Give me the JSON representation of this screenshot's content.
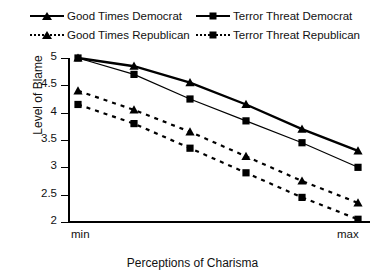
{
  "chart_data": {
    "type": "line",
    "title": "",
    "xlabel": "Perceptions of Charisma",
    "ylabel": "Level of Blame",
    "x": [
      0,
      1,
      2,
      3,
      4,
      5
    ],
    "x_tick_labels": [
      "min",
      "",
      "",
      "",
      "",
      "max"
    ],
    "xlim": [
      0,
      5
    ],
    "ylim": [
      2,
      5
    ],
    "y_ticks": [
      2,
      2.5,
      3,
      3.5,
      4,
      4.5,
      5
    ],
    "y_tick_labels": [
      "2",
      "2.5",
      "3",
      "3.5",
      "4",
      "4.5",
      "5"
    ],
    "grid": false,
    "legend_position": "top",
    "series": [
      {
        "name": "Good Times Democrat",
        "marker": "triangle",
        "line_style": "solid",
        "line_width": 2.4,
        "color": "#000000",
        "values": [
          5.0,
          4.85,
          4.55,
          4.15,
          3.7,
          3.3
        ]
      },
      {
        "name": "Terror Threat Democrat",
        "marker": "square",
        "line_style": "solid",
        "line_width": 1.2,
        "color": "#000000",
        "values": [
          5.0,
          4.7,
          4.25,
          3.85,
          3.45,
          3.0
        ]
      },
      {
        "name": "Good Times Republican",
        "marker": "triangle",
        "line_style": "dashed",
        "line_width": 2.2,
        "color": "#000000",
        "values": [
          4.4,
          4.05,
          3.65,
          3.2,
          2.75,
          2.35
        ]
      },
      {
        "name": "Terror Threat Republican",
        "marker": "square",
        "line_style": "dashed",
        "line_width": 2.2,
        "color": "#000000",
        "values": [
          4.15,
          3.8,
          3.35,
          2.9,
          2.45,
          2.05
        ]
      }
    ]
  },
  "legend": {
    "rows": [
      [
        {
          "label": "Good Times Democrat",
          "marker": "triangle",
          "line_style": "solid"
        },
        {
          "label": "Terror Threat Democrat",
          "marker": "square",
          "line_style": "solid"
        }
      ],
      [
        {
          "label": "Good Times Republican",
          "marker": "triangle",
          "line_style": "dashed"
        },
        {
          "label": "Terror Threat Republican",
          "marker": "square",
          "line_style": "dashed"
        }
      ]
    ]
  },
  "axes": {
    "y_title": "Level of Blame",
    "x_title": "Perceptions of Charisma",
    "x_min_label": "min",
    "x_max_label": "max"
  }
}
